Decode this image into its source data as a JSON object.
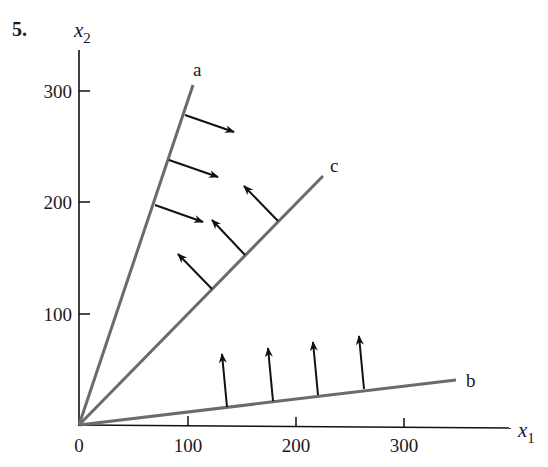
{
  "problem_number": "5.",
  "axes": {
    "x_label": "x",
    "x_sub": "1",
    "y_label": "x",
    "y_sub": "2",
    "x_ticks": [
      {
        "value": 0,
        "label": "0"
      },
      {
        "value": 100,
        "label": "100"
      },
      {
        "value": 200,
        "label": "200"
      },
      {
        "value": 300,
        "label": "300"
      }
    ],
    "y_ticks": [
      {
        "value": 100,
        "label": "100"
      },
      {
        "value": 200,
        "label": "200"
      },
      {
        "value": 300,
        "label": "300"
      }
    ]
  },
  "lines": [
    {
      "name": "a",
      "label": "a",
      "end": [
        103,
        307
      ],
      "arrow_direction": "right-down"
    },
    {
      "name": "c",
      "label": "c",
      "end": [
        226,
        224
      ],
      "arrow_direction": "left-up"
    },
    {
      "name": "b",
      "label": "b",
      "end": [
        348,
        41
      ],
      "arrow_direction": "up"
    }
  ],
  "colors": {
    "axis": "#111111",
    "line": "#6b6b6b",
    "arrow": "#111111"
  }
}
